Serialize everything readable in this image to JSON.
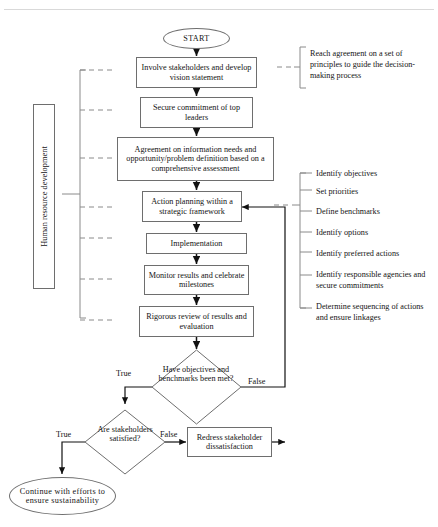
{
  "diagram": {
    "title_rule": "",
    "nodes": {
      "start": "START",
      "involve": "Involve stakeholders and develop vision statement",
      "secure": "Secure commitment of top leaders",
      "agreement": "Agreement on information needs and opportunity/problem definition based on a comprehensive assessment",
      "action_planning": "Action planning within a strategic framework",
      "implementation": "Implementation",
      "monitor": "Monitor results and celebrate milestones",
      "review": "Rigorous review of results and evaluation",
      "decision_objectives": "Have objectives and benchmarks been met?",
      "decision_stakeholders": "Are stakeholders satisfied?",
      "redress": "Redress stakeholder dissatisfaction",
      "continue": "Continue with efforts to ensure sustainability"
    },
    "edge_labels": {
      "objectives_true": "True",
      "objectives_false": "False",
      "stakeholders_true": "True",
      "stakeholders_false": "False"
    },
    "annotations": {
      "principles": "Reach agreement on a set of principles to guide the decision-making process",
      "hrd": "Human resource development"
    },
    "planning_items": [
      "Identify objectives",
      "Set priorities",
      "Define benchmarks",
      "Identify options",
      "Identify preferred actions",
      "Identify responsible agencies and secure commitments",
      "Determine sequencing of actions and ensure linkages"
    ],
    "colors": {
      "stroke": "#6e6e6e",
      "arrow": "#111111",
      "text": "#141414",
      "dash": "#8a8a8a"
    }
  }
}
